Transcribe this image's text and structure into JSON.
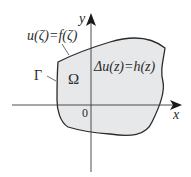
{
  "diagram": {
    "type": "domain-boundary-value-problem",
    "colors": {
      "fill": "#e6e8ea",
      "stroke": "#2a2a2a",
      "axis": "#3a3a3a",
      "background": "#ffffff"
    },
    "axes": {
      "x_label": "x",
      "y_label": "y",
      "origin_label": "0"
    },
    "labels": {
      "boundary_condition": "u(ζ)=f(ζ)",
      "boundary_name": "Γ",
      "region_name": "Ω",
      "equation": "Δu(z)=h(z)"
    }
  }
}
